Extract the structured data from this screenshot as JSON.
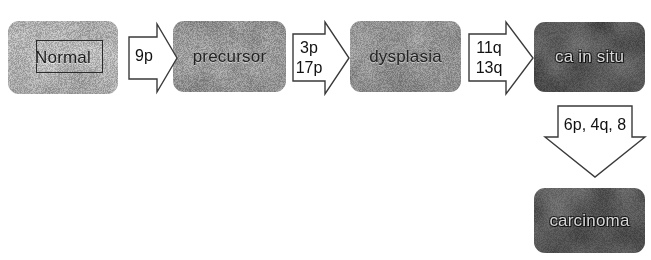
{
  "diagram": {
    "type": "flow-diagram",
    "background_color": "#ffffff",
    "stages": [
      {
        "id": "normal",
        "label": "Normal",
        "tone": "light",
        "fill_color": "#b7b7b7",
        "text_color": "#1c1c1c",
        "has_inner_frame": true,
        "x": 8,
        "y": 21,
        "width": 110,
        "height": 73
      },
      {
        "id": "precursor",
        "label": "precursor",
        "tone": "mid",
        "fill_color": "#a0a0a0",
        "text_color": "#232323",
        "has_inner_frame": false,
        "x": 173,
        "y": 21,
        "width": 113,
        "height": 71
      },
      {
        "id": "dysplasia",
        "label": "dysplasia",
        "tone": "mid",
        "fill_color": "#9a9a9a",
        "text_color": "#232323",
        "has_inner_frame": false,
        "x": 350,
        "y": 21,
        "width": 111,
        "height": 71
      },
      {
        "id": "ca-in-situ",
        "label": "ca in situ",
        "tone": "dark",
        "fill_color": "#5c5c5c",
        "text_color": "#d8d8d8",
        "has_inner_frame": false,
        "x": 534,
        "y": 22,
        "width": 111,
        "height": 70
      },
      {
        "id": "carcinoma",
        "label": "carcinoma",
        "tone": "dark",
        "fill_color": "#5e5e5e",
        "text_color": "#d8d8d8",
        "has_inner_frame": false,
        "x": 534,
        "y": 188,
        "width": 111,
        "height": 65
      }
    ],
    "arrows": [
      {
        "id": "normal-to-precursor",
        "direction": "right",
        "lines": [
          "9p"
        ],
        "from": "normal",
        "to": "precursor",
        "x": 128,
        "y": 23,
        "width": 50,
        "height": 70
      },
      {
        "id": "precursor-to-dysplasia",
        "direction": "right",
        "lines": [
          "3p",
          "17p"
        ],
        "from": "precursor",
        "to": "dysplasia",
        "x": 292,
        "y": 21,
        "width": 58,
        "height": 74
      },
      {
        "id": "dysplasia-to-ca-in-situ",
        "direction": "right",
        "lines": [
          "11q",
          "13q"
        ],
        "from": "dysplasia",
        "to": "ca-in-situ",
        "x": 468,
        "y": 21,
        "width": 66,
        "height": 74
      },
      {
        "id": "ca-in-situ-to-carcinoma",
        "direction": "down",
        "lines": [
          "6p, 4q, 8"
        ],
        "from": "ca-in-situ",
        "to": "carcinoma",
        "x": 544,
        "y": 105,
        "width": 102,
        "height": 74
      }
    ],
    "stroke_color": "#3a3a3a"
  }
}
